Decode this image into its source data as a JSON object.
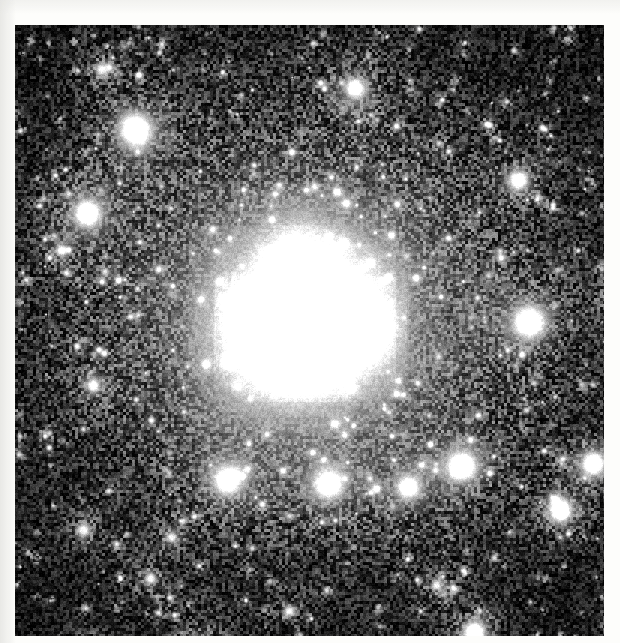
{
  "page": {
    "width": 620,
    "height": 643,
    "background_color": "#fdfdfb",
    "caption": ""
  },
  "image": {
    "kind": "astronomical-photographic-plate",
    "title": "Grayscale astronomical image of a galaxy field",
    "colorspace": "grayscale",
    "frame": {
      "x": 15,
      "y": 25,
      "width": 589,
      "height": 611
    },
    "background_color": "#060606",
    "brightest_color": "#ffffff",
    "noise": {
      "description": "heavy speckle / halftone grain across the plate",
      "amplitude": 0.42,
      "cell_size_px": 3
    }
  },
  "chart_data": {
    "type": "heatmap",
    "xlabel": "",
    "ylabel": "",
    "colormap": "grayscale",
    "value_range": [
      0,
      255
    ],
    "grid": false,
    "legend": "none",
    "galaxy": {
      "name": "central-galaxy",
      "center": {
        "x": 290,
        "y": 295
      },
      "outer_halo": {
        "rx": 215,
        "ry": 205,
        "peak_value": 96,
        "falloff": 2.1
      },
      "inner_halo": {
        "rx": 128,
        "ry": 122,
        "peak_value": 128,
        "falloff": 2.0,
        "angle_deg": -12
      },
      "smooth_core_disk": {
        "rx": 96,
        "ry": 88,
        "peak_value": 150,
        "falloff": 2.2,
        "angle_deg": -10
      },
      "bright_knots": [
        {
          "x": 289,
          "y": 268,
          "rx": 26,
          "ry": 42,
          "value": 255,
          "angle_deg": -8
        },
        {
          "x": 277,
          "y": 304,
          "rx": 40,
          "ry": 34,
          "value": 255,
          "angle_deg": 0
        },
        {
          "x": 270,
          "y": 322,
          "rx": 27,
          "ry": 22,
          "value": 255,
          "angle_deg": 0
        },
        {
          "x": 316,
          "y": 295,
          "rx": 30,
          "ry": 24,
          "value": 250,
          "angle_deg": 0
        },
        {
          "x": 343,
          "y": 301,
          "rx": 19,
          "ry": 17,
          "value": 248,
          "angle_deg": 0
        },
        {
          "x": 232,
          "y": 279,
          "rx": 12,
          "ry": 11,
          "value": 225,
          "angle_deg": 0
        }
      ]
    },
    "point_sources": [
      {
        "x": 120,
        "y": 104,
        "r": 17,
        "peak": 238,
        "halo_r": 34,
        "halo": 120
      },
      {
        "x": 72,
        "y": 188,
        "r": 14,
        "peak": 232,
        "halo_r": 28,
        "halo": 112
      },
      {
        "x": 340,
        "y": 63,
        "r": 11,
        "peak": 196,
        "halo_r": 24,
        "halo": 96
      },
      {
        "x": 503,
        "y": 155,
        "r": 11,
        "peak": 198,
        "halo_r": 22,
        "halo": 92
      },
      {
        "x": 514,
        "y": 297,
        "r": 17,
        "peak": 244,
        "halo_r": 30,
        "halo": 108
      },
      {
        "x": 447,
        "y": 441,
        "r": 15,
        "peak": 240,
        "halo_r": 28,
        "halo": 118
      },
      {
        "x": 393,
        "y": 462,
        "r": 11,
        "peak": 196,
        "halo_r": 22,
        "halo": 112
      },
      {
        "x": 313,
        "y": 459,
        "r": 13,
        "peak": 236,
        "halo_r": 26,
        "halo": 118
      },
      {
        "x": 212,
        "y": 455,
        "r": 13,
        "peak": 218,
        "halo_r": 26,
        "halo": 118
      },
      {
        "x": 578,
        "y": 438,
        "r": 14,
        "peak": 240,
        "halo_r": 26,
        "halo": 96
      },
      {
        "x": 545,
        "y": 485,
        "r": 14,
        "peak": 243,
        "halo_r": 26,
        "halo": 90
      },
      {
        "x": 459,
        "y": 607,
        "r": 14,
        "peak": 236,
        "halo_r": 27,
        "halo": 88
      },
      {
        "x": 182,
        "y": 627,
        "r": 16,
        "peak": 238,
        "halo_r": 30,
        "halo": 92
      },
      {
        "x": 73,
        "y": 627,
        "r": 11,
        "peak": 198,
        "halo_r": 22,
        "halo": 80
      },
      {
        "x": 605,
        "y": 597,
        "r": 12,
        "peak": 206,
        "halo_r": 22,
        "halo": 80
      },
      {
        "x": 602,
        "y": 270,
        "r": 10,
        "peak": 190,
        "halo_r": 20,
        "halo": 80
      },
      {
        "x": 78,
        "y": 360,
        "r": 8,
        "peak": 150,
        "halo_r": 17,
        "halo": 72
      },
      {
        "x": 68,
        "y": 505,
        "r": 9,
        "peak": 140,
        "halo_r": 18,
        "halo": 70
      },
      {
        "x": 135,
        "y": 553,
        "r": 8,
        "peak": 140,
        "halo_r": 16,
        "halo": 68
      },
      {
        "x": 156,
        "y": 512,
        "r": 7,
        "peak": 132,
        "halo_r": 15,
        "halo": 64
      },
      {
        "x": 46,
        "y": 225,
        "r": 7,
        "peak": 150,
        "halo_r": 14,
        "halo": 62
      },
      {
        "x": 86,
        "y": 44,
        "r": 9,
        "peak": 130,
        "halo_r": 18,
        "halo": 66
      },
      {
        "x": 274,
        "y": 586,
        "r": 7,
        "peak": 150,
        "halo_r": 14,
        "halo": 62
      },
      {
        "x": 421,
        "y": 560,
        "r": 7,
        "peak": 140,
        "halo_r": 14,
        "halo": 58
      }
    ],
    "faint_stars_count": 520
  }
}
